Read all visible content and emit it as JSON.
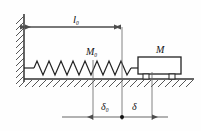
{
  "figure": {
    "name": "spring-mass-on-ground-diagram",
    "type": "mechanics-free-body-diagram",
    "background_color": "#fefefe",
    "stroke_color": "#333333",
    "dimension_color": "#555555"
  },
  "labels": {
    "natural_length": {
      "symbol": "l",
      "subscript": "0",
      "text": "l₀"
    },
    "spring_mass": {
      "symbol": "M",
      "subscript": "0",
      "text": "M₀"
    },
    "block_mass": {
      "symbol": "M",
      "subscript": "",
      "text": "M"
    },
    "static_deflection": {
      "symbol": "δ",
      "subscript": "0",
      "text": "δ₀"
    },
    "displacement": {
      "symbol": "δ",
      "subscript": "",
      "text": "δ"
    }
  },
  "elements": {
    "wall": "hatched-vertical-wall",
    "ground": "hatched-horizontal-ground",
    "spring": "zigzag-coil-spring",
    "cart": "rectangular-block-with-two-wheels",
    "dimension_top": "l0-double-arrow-dimension",
    "dimension_bottom": "delta0-delta-double-arrow-dimension",
    "reference_marker": "filled-dot-at-equilibrium"
  },
  "geometry": {
    "wall_x": 24,
    "ground_y": 79,
    "spring_start_x": 24,
    "spring_end_x": 138,
    "ref_line_left_x": 93,
    "ref_line_mid_x": 122,
    "ref_line_right_x": 152,
    "dim_top_y": 27,
    "dim_bottom_y": 117,
    "spring_axis_y": 68,
    "cart_left_x": 138,
    "cart_right_x": 181,
    "cart_top_y": 57,
    "cart_bottom_y": 74,
    "spring_coils": 11
  }
}
